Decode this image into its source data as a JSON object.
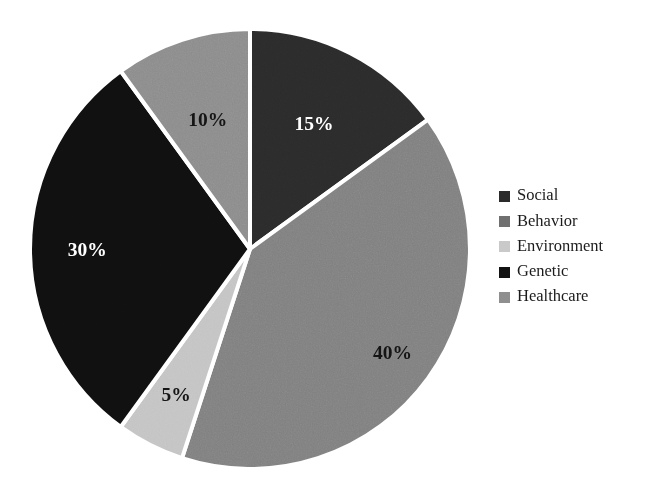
{
  "chart_data": {
    "type": "pie",
    "title": "",
    "subtitle": "",
    "xlabel": "",
    "ylabel": "",
    "grid": false,
    "legend_position": "right",
    "start_angle_deg": 0,
    "direction": "clockwise",
    "slice_border_color": "#ffffff",
    "background": "#ffffff",
    "categories": [
      "Social",
      "Behavior",
      "Environment",
      "Genetic",
      "Healthcare"
    ],
    "values": [
      15,
      40,
      5,
      30,
      10
    ],
    "value_unit": "%",
    "data_labels": [
      "15%",
      "40%",
      "5%",
      "30%",
      "10%"
    ],
    "colors": [
      "#2b2b2b",
      "#808080",
      "#c4c4c4",
      "#101010",
      "#8c8c8c"
    ],
    "label_colors": [
      "#ffffff",
      "#141414",
      "#141414",
      "#ffffff",
      "#141414"
    ],
    "slices": [
      {
        "name": "Social",
        "value": 15,
        "label": "15%",
        "color": "#2b2b2b",
        "label_color": "#ffffff"
      },
      {
        "name": "Behavior",
        "value": 40,
        "label": "40%",
        "color": "#808080",
        "label_color": "#141414"
      },
      {
        "name": "Environment",
        "value": 5,
        "label": "5%",
        "color": "#c4c4c4",
        "label_color": "#141414"
      },
      {
        "name": "Genetic",
        "value": 30,
        "label": "30%",
        "color": "#101010",
        "label_color": "#ffffff"
      },
      {
        "name": "Healthcare",
        "value": 10,
        "label": "10%",
        "color": "#8c8c8c",
        "label_color": "#141414"
      }
    ]
  },
  "legend": {
    "items": [
      {
        "label": "Social",
        "color": "#2b2b2b"
      },
      {
        "label": "Behavior",
        "color": "#707070"
      },
      {
        "label": "Environment",
        "color": "#c9c9c9"
      },
      {
        "label": "Genetic",
        "color": "#131313"
      },
      {
        "label": "Healthcare",
        "color": "#8f8f8f"
      }
    ]
  },
  "labels": {
    "social_pct": "15%",
    "behavior_pct": "40%",
    "environment_pct": "5%",
    "genetic_pct": "30%",
    "healthcare_pct": "10%"
  }
}
